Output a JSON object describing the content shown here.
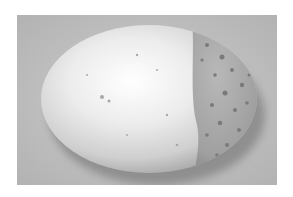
{
  "image": {
    "subject": "speckled egg",
    "description": "Grayscale photograph of an egg lying on its side on a textured light-gray surface; the right end of the egg is darker and more heavily speckled, with a sharp boundary between the pale left portion and the darker right cap.",
    "colors": {
      "border": "#ffffff",
      "background": "#bdbdbd",
      "egg_light": "#f4f4f4",
      "egg_dark_cap": "#9a9a9a",
      "speckle": "#7a7a7a",
      "shadow": "#5a5a5a"
    }
  }
}
